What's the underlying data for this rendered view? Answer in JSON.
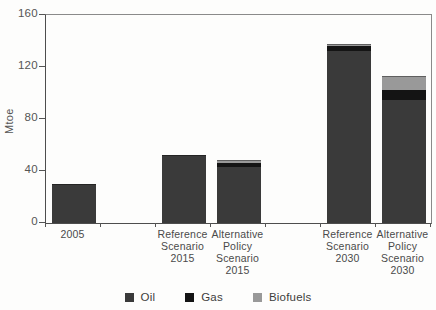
{
  "chart_data": {
    "type": "bar",
    "stacked": true,
    "title": "",
    "ylabel": "Mtoe",
    "xlabel": "",
    "ylim": [
      0,
      160
    ],
    "yticks": [
      0,
      40,
      80,
      120,
      160
    ],
    "grid": false,
    "legend_position": "bottom",
    "num_slots": 7,
    "slot_indices": [
      0,
      2,
      3,
      5,
      6
    ],
    "categories": [
      "2005",
      "Reference\nScenario\n2015",
      "Alternative\nPolicy\nScenario\n2015",
      "Reference\nScenario\n2030",
      "Alternative\nPolicy\nScenario\n2030"
    ],
    "series": [
      {
        "name": "Oil",
        "color": "#3a3a3a",
        "values": [
          30,
          52,
          43,
          132,
          94.5
        ]
      },
      {
        "name": "Gas",
        "color": "#141414",
        "values": [
          0,
          0,
          3,
          4.5,
          7.5
        ]
      },
      {
        "name": "Biofuels",
        "color": "#999999",
        "values": [
          0,
          0,
          2.5,
          1.5,
          11
        ]
      }
    ]
  },
  "colors": {
    "oil": "#3a3a3a",
    "gas": "#141414",
    "biofuels": "#999999",
    "axis": "#4d4d4d",
    "plot_border": "#8a8a8a"
  }
}
